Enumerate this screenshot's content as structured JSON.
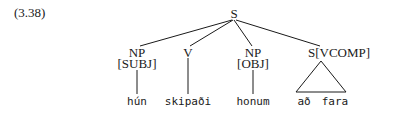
{
  "example_number": "(3.38)",
  "tree": {
    "root": "S",
    "children": [
      {
        "label": "NP",
        "feature": "[SUBJ]",
        "leaf": "hún"
      },
      {
        "label": "V",
        "feature": "",
        "leaf": "skipaði"
      },
      {
        "label": "NP",
        "feature": "[OBJ]",
        "leaf": "honum"
      },
      {
        "label": "S[VCOMP]",
        "feature": "",
        "leaf_words": [
          "að",
          "fara"
        ],
        "collapsed_triangle": true
      }
    ]
  }
}
